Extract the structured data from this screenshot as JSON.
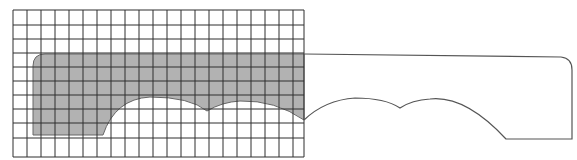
{
  "figure": {
    "grid": {
      "x0": 13,
      "y0": 10,
      "x1": 304,
      "y1": 157,
      "cols": [
        13,
        27,
        41,
        55,
        69,
        83,
        97,
        111,
        125,
        139,
        153,
        167,
        181,
        195,
        209,
        223,
        237,
        251,
        265,
        279,
        293,
        304
      ],
      "rows": [
        10,
        25,
        39,
        53,
        67,
        81,
        95,
        109,
        123,
        138,
        157
      ],
      "line_color": "#2e2e2e"
    },
    "shaded_region": {
      "fill": "#b2b2b2",
      "path": "M33,66 Q33,54 45,54 L304,54 L304,120 Q275,100 240,101 Q222,102 207,111 Q190,97 150,97 Q115,99 103,135 L33,135 Z"
    },
    "outline_shape": {
      "stroke": "#555555",
      "path": "M304,54 L561,57 Q572,58 572,70 L572,139 L506,139 Q465,95 430,99 Q412,100 400,108 Q385,98 355,98 Q325,100 304,120"
    }
  }
}
